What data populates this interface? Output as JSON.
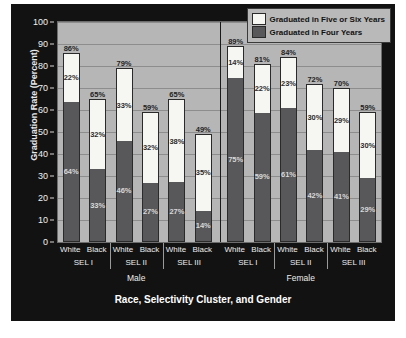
{
  "chart_data": {
    "type": "bar",
    "subtype": "stacked-grouped",
    "title": "",
    "xlabel": "Race, Selectivity Cluster, and Gender",
    "ylabel": "Graduation Rate (Percent)",
    "ylim": [
      0,
      100
    ],
    "ytick_step": 10,
    "yticks": [
      "0",
      "10",
      "20",
      "30",
      "40",
      "50",
      "60",
      "70",
      "80",
      "90",
      "100"
    ],
    "grid": true,
    "legend_position": "top-right",
    "legend": [
      {
        "label": "Graduated in Five or Six Years",
        "color": "#f6f6f2",
        "key": "five_or_six"
      },
      {
        "label": "Graduated in Four Years",
        "color": "#58585a",
        "key": "four"
      }
    ],
    "series": [
      {
        "name": "Graduated in Four Years",
        "values": [
          64,
          33,
          46,
          27,
          27,
          14,
          75,
          59,
          61,
          42,
          41,
          29
        ]
      },
      {
        "name": "Graduated in Five or Six Years",
        "values": [
          22,
          32,
          33,
          32,
          38,
          35,
          14,
          22,
          23,
          30,
          29,
          30
        ]
      }
    ],
    "totals": [
      86,
      65,
      79,
      59,
      65,
      49,
      89,
      81,
      84,
      72,
      70,
      59
    ],
    "categories": [
      "Male / SEL I / White",
      "Male / SEL I / Black",
      "Male / SEL II / White",
      "Male / SEL II / Black",
      "Male / SEL III / White",
      "Male / SEL III / Black",
      "Female / SEL I / White",
      "Female / SEL I / Black",
      "Female / SEL II / White",
      "Female / SEL II / Black",
      "Female / SEL III / White",
      "Female / SEL III / Black"
    ],
    "bars": [
      {
        "gender": "Male",
        "cluster": "SEL I",
        "race": "White",
        "four": 64,
        "five_or_six": 22,
        "total": 86,
        "four_label": "64%",
        "five_or_six_label": "22%",
        "total_label": "86%"
      },
      {
        "gender": "Male",
        "cluster": "SEL I",
        "race": "Black",
        "four": 33,
        "five_or_six": 32,
        "total": 65,
        "four_label": "33%",
        "five_or_six_label": "32%",
        "total_label": "65%"
      },
      {
        "gender": "Male",
        "cluster": "SEL II",
        "race": "White",
        "four": 46,
        "five_or_six": 33,
        "total": 79,
        "four_label": "46%",
        "five_or_six_label": "33%",
        "total_label": "79%"
      },
      {
        "gender": "Male",
        "cluster": "SEL II",
        "race": "Black",
        "four": 27,
        "five_or_six": 32,
        "total": 59,
        "four_label": "27%",
        "five_or_six_label": "32%",
        "total_label": "59%"
      },
      {
        "gender": "Male",
        "cluster": "SEL III",
        "race": "White",
        "four": 27,
        "five_or_six": 38,
        "total": 65,
        "four_label": "27%",
        "five_or_six_label": "38%",
        "total_label": "65%"
      },
      {
        "gender": "Male",
        "cluster": "SEL III",
        "race": "Black",
        "four": 14,
        "five_or_six": 35,
        "total": 49,
        "four_label": "14%",
        "five_or_six_label": "35%",
        "total_label": "49%"
      },
      {
        "gender": "Female",
        "cluster": "SEL I",
        "race": "White",
        "four": 75,
        "five_or_six": 14,
        "total": 89,
        "four_label": "75%",
        "five_or_six_label": "14%",
        "total_label": "89%"
      },
      {
        "gender": "Female",
        "cluster": "SEL I",
        "race": "Black",
        "four": 59,
        "five_or_six": 22,
        "total": 81,
        "four_label": "59%",
        "five_or_six_label": "22%",
        "total_label": "81%"
      },
      {
        "gender": "Female",
        "cluster": "SEL II",
        "race": "White",
        "four": 61,
        "five_or_six": 23,
        "total": 84,
        "four_label": "61%",
        "five_or_six_label": "23%",
        "total_label": "84%"
      },
      {
        "gender": "Female",
        "cluster": "SEL II",
        "race": "Black",
        "four": 42,
        "five_or_six": 30,
        "total": 72,
        "four_label": "42%",
        "five_or_six_label": "30%",
        "total_label": "72%"
      },
      {
        "gender": "Female",
        "cluster": "SEL III",
        "race": "White",
        "four": 41,
        "five_or_six": 29,
        "total": 70,
        "four_label": "41%",
        "five_or_six_label": "29%",
        "total_label": "70%"
      },
      {
        "gender": "Female",
        "cluster": "SEL III",
        "race": "Black",
        "four": 29,
        "five_or_six": 30,
        "total": 59,
        "four_label": "29%",
        "five_or_six_label": "30%",
        "total_label": "59%"
      }
    ],
    "cluster_labels": [
      "SEL I",
      "SEL II",
      "SEL III",
      "SEL I",
      "SEL II",
      "SEL III"
    ],
    "gender_labels": [
      "Male",
      "Female"
    ]
  },
  "colors": {
    "panel_background": "#121212",
    "plot_background": "#b6b6b6",
    "gridline": "#8d8d8d",
    "four_years": "#58585a",
    "five_or_six_years": "#f6f6f2",
    "axis_text": "#ededed"
  }
}
